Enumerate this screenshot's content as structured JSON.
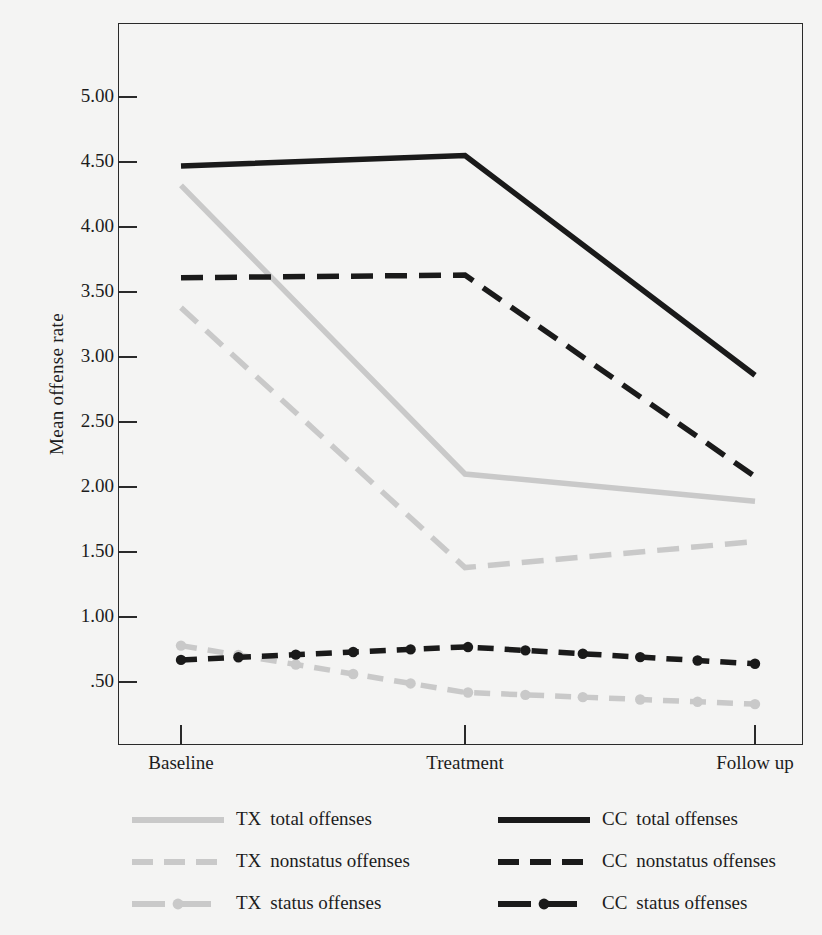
{
  "figure": {
    "background_color": "#f4f4f3",
    "frame_color": "#2a2a2a",
    "tx_color": "#c9c9c9",
    "cc_color": "#1a1a1a"
  },
  "axes": {
    "y_axis_title": "Mean offense rate",
    "y_ticks": [
      {
        "label": "5.00",
        "value": 5.0
      },
      {
        "label": "4.50",
        "value": 4.5
      },
      {
        "label": "4.00",
        "value": 4.0
      },
      {
        "label": "3.50",
        "value": 3.5
      },
      {
        "label": "3.00",
        "value": 3.0
      },
      {
        "label": "2.50",
        "value": 2.5
      },
      {
        "label": "2.00",
        "value": 2.0
      },
      {
        "label": "1.50",
        "value": 1.5
      },
      {
        "label": "1.00",
        "value": 1.0
      },
      {
        "label": ".50",
        "value": 0.5
      }
    ],
    "x_ticks": [
      {
        "label": "Baseline"
      },
      {
        "label": "Treatment"
      },
      {
        "label": "Follow up"
      }
    ]
  },
  "legend": {
    "position": "below-plot",
    "columns": [
      {
        "group": "TX",
        "entries": [
          {
            "code": "TX",
            "name": "total offenses",
            "style": "solid",
            "color": "#c9c9c9"
          },
          {
            "code": "TX",
            "name": "nonstatus offenses",
            "style": "dashed",
            "color": "#c9c9c9"
          },
          {
            "code": "TX",
            "name": "status offenses",
            "style": "dash-dotted",
            "color": "#c9c9c9"
          }
        ]
      },
      {
        "group": "CC",
        "entries": [
          {
            "code": "CC",
            "name": "total offenses",
            "style": "solid",
            "color": "#1a1a1a"
          },
          {
            "code": "CC",
            "name": "nonstatus offenses",
            "style": "dashed",
            "color": "#1a1a1a"
          },
          {
            "code": "CC",
            "name": "status offenses",
            "style": "dash-dotted",
            "color": "#1a1a1a"
          }
        ]
      }
    ]
  },
  "chart_data": {
    "type": "line",
    "title": "",
    "xlabel": "",
    "ylabel": "Mean offense rate",
    "categories": [
      "Baseline",
      "Treatment",
      "Follow up"
    ],
    "ylim": [
      0,
      5.5
    ],
    "yticks": [
      0.5,
      1.0,
      1.5,
      2.0,
      2.5,
      3.0,
      3.5,
      4.0,
      4.5,
      5.0
    ],
    "grid": false,
    "legend_position": "below",
    "series": [
      {
        "name": "TX  total offenses",
        "group": "TX",
        "measure": "total offenses",
        "color": "#c9c9c9",
        "style": "solid",
        "markers": false,
        "values": [
          4.32,
          2.1,
          1.89
        ]
      },
      {
        "name": "TX  nonstatus offenses",
        "group": "TX",
        "measure": "nonstatus offenses",
        "color": "#c9c9c9",
        "style": "dashed",
        "markers": false,
        "values": [
          3.38,
          1.38,
          1.58
        ]
      },
      {
        "name": "TX  status offenses",
        "group": "TX",
        "measure": "status offenses",
        "color": "#c9c9c9",
        "style": "dash-dotted",
        "markers": true,
        "values": [
          0.78,
          0.42,
          0.33
        ]
      },
      {
        "name": "CC  total offenses",
        "group": "CC",
        "measure": "total offenses",
        "color": "#1a1a1a",
        "style": "solid",
        "markers": false,
        "values": [
          4.47,
          4.55,
          2.86
        ]
      },
      {
        "name": "CC  nonstatus offenses",
        "group": "CC",
        "measure": "nonstatus offenses",
        "color": "#1a1a1a",
        "style": "dashed",
        "markers": false,
        "values": [
          3.61,
          3.63,
          2.08
        ]
      },
      {
        "name": "CC  status offenses",
        "group": "CC",
        "measure": "status offenses",
        "color": "#1a1a1a",
        "style": "dash-dotted",
        "markers": true,
        "values": [
          0.67,
          0.77,
          0.64
        ]
      }
    ]
  }
}
